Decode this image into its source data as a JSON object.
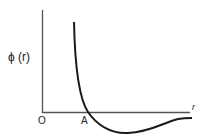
{
  "diagram": {
    "type": "potential-energy-curve",
    "y_axis_label": "ϕ (r)",
    "x_axis_label": "r",
    "origin_label": "O",
    "point_label": "A",
    "colors": {
      "line": "#1a1a1a",
      "axis": "#555555",
      "background": "#ffffff"
    }
  }
}
